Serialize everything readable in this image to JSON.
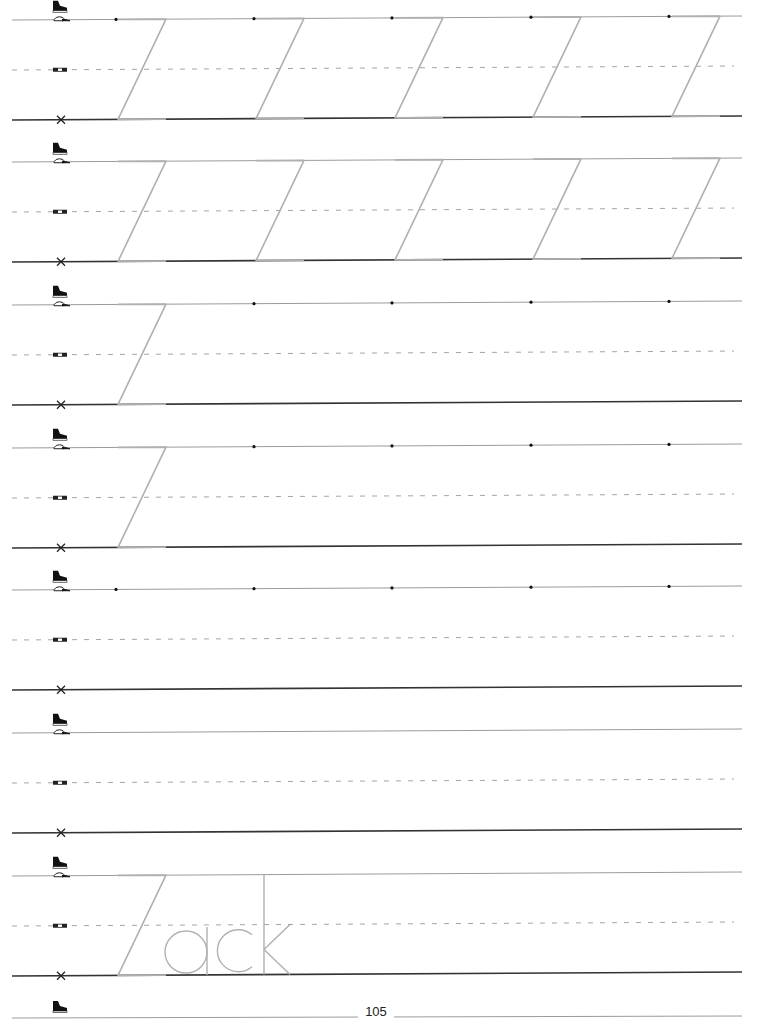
{
  "worksheet": {
    "letter": "Z",
    "page_number": "105",
    "row_guides": {
      "top_icon": "cap-icon",
      "middle_icon": "belt-icon",
      "bottom_icon": "x-mark-icon",
      "above_top_icon": "sneaker-icon"
    },
    "rows": [
      {
        "type": "trace",
        "z_count": 5,
        "dots": 5
      },
      {
        "type": "trace",
        "z_count": 5,
        "dots": 0
      },
      {
        "type": "trace-start",
        "z_count": 1,
        "dots": 4
      },
      {
        "type": "trace-start",
        "z_count": 1,
        "dots": 4
      },
      {
        "type": "dots-only",
        "z_count": 0,
        "dots": 5
      },
      {
        "type": "blank",
        "z_count": 0,
        "dots": 0
      },
      {
        "type": "word",
        "z_count": 0,
        "dots": 0,
        "word": "Zack",
        "word_rest": "ack"
      }
    ],
    "colors": {
      "guide_line": "#9a9a9a",
      "baseline": "#333333",
      "trace": "#b0b0b0",
      "dot": "#111111"
    }
  }
}
